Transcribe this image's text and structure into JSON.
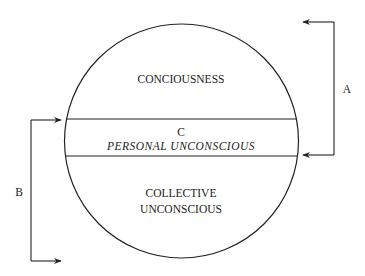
{
  "diagram": {
    "regions": {
      "top": {
        "label": "CONCIOUSNESS"
      },
      "middle": {
        "letter": "C",
        "label": "PERSONAL UNCONSCIOUS"
      },
      "bottom": {
        "line1": "COLLECTIVE",
        "line2": "UNCONSCIOUS"
      }
    },
    "brackets": {
      "right": {
        "label": "A"
      },
      "left": {
        "label": "B"
      }
    },
    "colors": {
      "stroke": "#222222",
      "background": "#ffffff"
    }
  }
}
